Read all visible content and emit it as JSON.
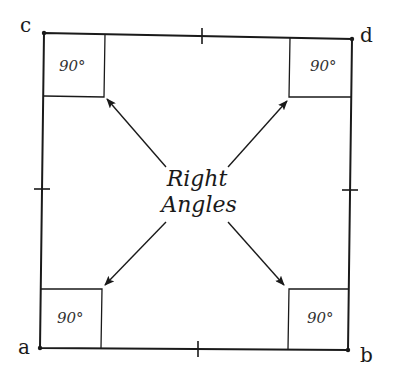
{
  "diagram": {
    "title": "Right Angles",
    "center_label_line1": "Right",
    "center_label_line2": "Angles",
    "vertices": {
      "a": {
        "label": "a",
        "position": "bottom-left"
      },
      "b": {
        "label": "b",
        "position": "bottom-right"
      },
      "c": {
        "label": "c",
        "position": "top-left"
      },
      "d": {
        "label": "d",
        "position": "top-right"
      }
    },
    "angles": [
      {
        "corner": "c",
        "value": "90°"
      },
      {
        "corner": "d",
        "value": "90°"
      },
      {
        "corner": "a",
        "value": "90°"
      },
      {
        "corner": "b",
        "value": "90°"
      }
    ],
    "tick_marks": [
      "top-midpoint",
      "bottom-midpoint",
      "left-midpoint",
      "right-midpoint"
    ],
    "colors": {
      "stroke": "#1a1a1a",
      "background": "#ffffff"
    }
  }
}
